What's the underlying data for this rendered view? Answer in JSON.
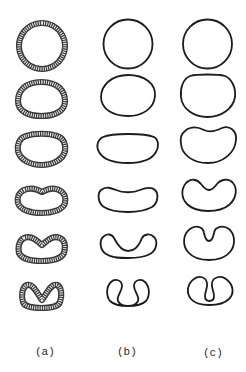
{
  "figure": {
    "columns": [
      {
        "id": "a",
        "label": "(a)",
        "style": "hatched-shell"
      },
      {
        "id": "b",
        "label": "(b)",
        "style": "thin-outline"
      },
      {
        "id": "c",
        "label": "(c)",
        "style": "thin-outline"
      }
    ],
    "stages": [
      "circle",
      "oval",
      "flattened-top",
      "shallow-dimple",
      "deep-dimple",
      "invaginated"
    ],
    "colors": {
      "line": "#1c1c1c",
      "shell": "#3a3a3a",
      "background": "#ffffff"
    }
  }
}
